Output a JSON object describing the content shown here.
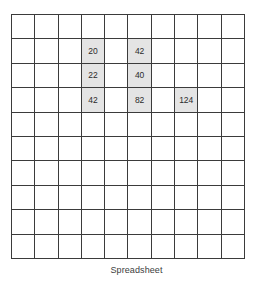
{
  "caption": "Spreadsheet",
  "grid": {
    "rows": 10,
    "cols": 10,
    "fill_color": "#e4e4e4",
    "line_color": "#3b3b3b",
    "background_color": "#ffffff",
    "cells": [
      [
        "",
        "",
        "",
        "",
        "",
        "",
        "",
        "",
        "",
        ""
      ],
      [
        "",
        "",
        "",
        "20",
        "",
        "42",
        "",
        "",
        "",
        ""
      ],
      [
        "",
        "",
        "",
        "22",
        "",
        "40",
        "",
        "",
        "",
        ""
      ],
      [
        "",
        "",
        "",
        "42",
        "",
        "82",
        "",
        "124",
        "",
        ""
      ],
      [
        "",
        "",
        "",
        "",
        "",
        "",
        "",
        "",
        "",
        ""
      ],
      [
        "",
        "",
        "",
        "",
        "",
        "",
        "",
        "",
        "",
        ""
      ],
      [
        "",
        "",
        "",
        "",
        "",
        "",
        "",
        "",
        "",
        ""
      ],
      [
        "",
        "",
        "",
        "",
        "",
        "",
        "",
        "",
        "",
        ""
      ],
      [
        "",
        "",
        "",
        "",
        "",
        "",
        "",
        "",
        "",
        ""
      ],
      [
        "",
        "",
        "",
        "",
        "",
        "",
        "",
        "",
        "",
        ""
      ]
    ]
  }
}
